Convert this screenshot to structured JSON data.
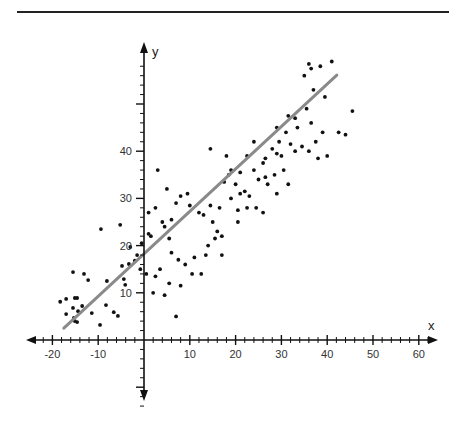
{
  "chart_data": {
    "type": "scatter",
    "title": "",
    "xlabel": "x",
    "ylabel": "y",
    "xlim": [
      -25,
      64
    ],
    "ylim": [
      -17,
      63
    ],
    "grid": false,
    "x_ticks": [
      -20,
      -10,
      10,
      20,
      30,
      40,
      50,
      60
    ],
    "x_tick_labels": [
      "-20",
      "-10",
      "10",
      "20",
      "30",
      "40",
      "50",
      "60"
    ],
    "y_ticks": [
      10,
      20,
      30,
      40,
      50
    ],
    "y_tick_labels": [
      "10",
      "20",
      "30",
      "40",
      ""
    ],
    "regression_line": {
      "x0": -17.5,
      "y0": 2.5,
      "x1": 42.1,
      "y1": 56.1,
      "color": "#8a8a8a"
    },
    "points": [
      [
        -15.5,
        14.4
      ],
      [
        -13.1,
        14.0
      ],
      [
        -12.2,
        12.7
      ],
      [
        -8.1,
        12.5
      ],
      [
        -18.3,
        8.1
      ],
      [
        -17.0,
        8.7
      ],
      [
        -15.1,
        8.9
      ],
      [
        -14.6,
        8.9
      ],
      [
        -15.5,
        6.8
      ],
      [
        -13.5,
        7.2
      ],
      [
        -14.4,
        6.1
      ],
      [
        -17.0,
        5.5
      ],
      [
        -15.3,
        4.7
      ],
      [
        -11.4,
        5.7
      ],
      [
        -8.3,
        7.4
      ],
      [
        -6.6,
        5.9
      ],
      [
        -9.6,
        3.2
      ],
      [
        -5.7,
        5.1
      ],
      [
        -14.6,
        3.8
      ],
      [
        -15.1,
        4.0
      ],
      [
        -4.1,
        11.7
      ],
      [
        -4.8,
        15.7
      ],
      [
        -3.3,
        16.1
      ],
      [
        -4.4,
        12.9
      ],
      [
        -9.4,
        23.5
      ],
      [
        -5.2,
        24.4
      ],
      [
        -3.0,
        19.7
      ],
      [
        -2.0,
        16.8
      ],
      [
        -1.5,
        18.0
      ],
      [
        -0.8,
        15.0
      ],
      [
        1.5,
        22.0
      ],
      [
        4.0,
        25.0
      ],
      [
        4.5,
        24.0
      ],
      [
        5.5,
        21.5
      ],
      [
        6.0,
        18.5
      ],
      [
        7.5,
        17.0
      ],
      [
        3.5,
        15.0
      ],
      [
        2.5,
        13.5
      ],
      [
        8.0,
        11.5
      ],
      [
        10.5,
        14.0
      ],
      [
        12.5,
        14.0
      ],
      [
        9.0,
        16.0
      ],
      [
        11.0,
        17.5
      ],
      [
        13.5,
        18.0
      ],
      [
        14.0,
        20.0
      ],
      [
        15.5,
        21.5
      ],
      [
        16.0,
        23.0
      ],
      [
        17.0,
        22.0
      ],
      [
        13.0,
        26.5
      ],
      [
        15.0,
        25.0
      ],
      [
        9.5,
        31.0
      ],
      [
        8.0,
        30.5
      ],
      [
        10.0,
        28.5
      ],
      [
        12.0,
        27.0
      ],
      [
        14.5,
        28.5
      ],
      [
        16.5,
        28.0
      ],
      [
        6.0,
        25.5
      ],
      [
        5.0,
        32.0
      ],
      [
        3.0,
        36.0
      ],
      [
        1.0,
        27.0
      ],
      [
        2.5,
        28.0
      ],
      [
        7.0,
        29.0
      ],
      [
        0.5,
        14.0
      ],
      [
        1.0,
        22.5
      ],
      [
        -0.5,
        20.5
      ],
      [
        2.0,
        10.0
      ],
      [
        4.5,
        9.5
      ],
      [
        7.0,
        5.0
      ],
      [
        5.5,
        12.0
      ],
      [
        17.5,
        33.5
      ],
      [
        19.0,
        36.0
      ],
      [
        18.5,
        35.0
      ],
      [
        20.0,
        33.0
      ],
      [
        21.0,
        31.0
      ],
      [
        22.0,
        31.5
      ],
      [
        20.5,
        27.5
      ],
      [
        22.5,
        28.0
      ],
      [
        23.0,
        30.5
      ],
      [
        18.0,
        39.0
      ],
      [
        14.5,
        40.5
      ],
      [
        19.0,
        30.0
      ],
      [
        17.0,
        18.0
      ],
      [
        20.5,
        25.0
      ],
      [
        24.0,
        36.0
      ],
      [
        26.0,
        37.5
      ],
      [
        25.0,
        34.0
      ],
      [
        27.0,
        33.0
      ],
      [
        26.5,
        38.5
      ],
      [
        28.0,
        40.5
      ],
      [
        29.0,
        39.5
      ],
      [
        24.5,
        28.0
      ],
      [
        26.5,
        34.5
      ],
      [
        28.5,
        35.0
      ],
      [
        30.0,
        39.0
      ],
      [
        29.5,
        42.0
      ],
      [
        31.0,
        44.0
      ],
      [
        32.0,
        41.5
      ],
      [
        30.5,
        36.0
      ],
      [
        33.0,
        40.0
      ],
      [
        29.0,
        31.0
      ],
      [
        26.0,
        27.0
      ],
      [
        31.5,
        47.5
      ],
      [
        33.5,
        45.0
      ],
      [
        35.5,
        49.0
      ],
      [
        36.5,
        46.0
      ],
      [
        34.5,
        41.0
      ],
      [
        37.5,
        42.0
      ],
      [
        39.0,
        44.0
      ],
      [
        36.0,
        40.0
      ],
      [
        38.0,
        38.5
      ],
      [
        40.0,
        39.0
      ],
      [
        35.0,
        56.0
      ],
      [
        36.0,
        58.5
      ],
      [
        36.5,
        57.5
      ],
      [
        38.5,
        58.0
      ],
      [
        41.0,
        59.0
      ],
      [
        39.5,
        51.5
      ],
      [
        42.5,
        44.0
      ],
      [
        44.0,
        43.5
      ],
      [
        45.5,
        48.5
      ],
      [
        37.0,
        53.0
      ],
      [
        33.0,
        47.0
      ],
      [
        31.5,
        33.0
      ],
      [
        29.0,
        45.0
      ],
      [
        24.0,
        42.0
      ],
      [
        22.5,
        39.0
      ],
      [
        21.0,
        35.5
      ]
    ],
    "point_color": "#111111",
    "axis_color": "#111111"
  }
}
